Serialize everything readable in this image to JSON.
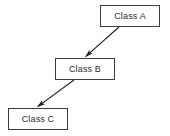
{
  "diagram": {
    "type": "class-hierarchy",
    "background_color": "#ffffff",
    "node_fill_color": "#ffffff",
    "node_border_color": "#3d3d3d",
    "edge_color": "#1e1e1e",
    "text_color": "#2b2b2b",
    "nodes": [
      {
        "id": "a",
        "label": "Class A",
        "x": 100,
        "y": 5,
        "width": 60,
        "height": 22
      },
      {
        "id": "b",
        "label": "Class B",
        "x": 55,
        "y": 58,
        "width": 60,
        "height": 22
      },
      {
        "id": "c",
        "label": "Class C",
        "x": 8,
        "y": 108,
        "width": 60,
        "height": 22
      }
    ],
    "edges": [
      {
        "id": "a-to-b",
        "from": "a",
        "to": "b",
        "from_point": [
          119,
          27
        ],
        "to_point": [
          85,
          57
        ],
        "arrowhead": "filled-triangle"
      },
      {
        "id": "b-to-c",
        "from": "b",
        "to": "c",
        "from_point": [
          74,
          80
        ],
        "to_point": [
          37,
          107
        ],
        "arrowhead": "filled-triangle"
      }
    ]
  }
}
